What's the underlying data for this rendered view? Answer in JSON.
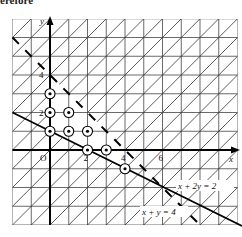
{
  "header_fragment": "erefore",
  "diagram": {
    "type": "linear-programming-feasible-region",
    "axes": {
      "x_label": "x",
      "y_label": "y",
      "origin_label": "O",
      "x_ticks": [
        {
          "value": 2,
          "label": "2"
        },
        {
          "value": 4,
          "label": "4"
        },
        {
          "value": 6,
          "label": "6"
        }
      ],
      "y_ticks": [
        {
          "value": 2,
          "label": "2"
        },
        {
          "value": 4,
          "label": "4"
        }
      ]
    },
    "grid": {
      "x_range": [
        -2,
        10
      ],
      "y_range": [
        -4,
        7
      ],
      "step": 1
    },
    "lines": [
      {
        "equation": "x + 2y = 2",
        "label": "x + 2y = 2",
        "style": "solid"
      },
      {
        "equation": "x + y = 4",
        "label": "x + y = 4",
        "style": "dashed"
      }
    ],
    "shading": "hatched region excluded (outside feasible set)",
    "lattice_points": [
      [
        0,
        1
      ],
      [
        0,
        2
      ],
      [
        0,
        3
      ],
      [
        1,
        1
      ],
      [
        1,
        2
      ],
      [
        2,
        0
      ],
      [
        2,
        1
      ],
      [
        3,
        0
      ],
      [
        4,
        -1
      ]
    ],
    "colors": {
      "ink": "#111111",
      "grid": "#444444",
      "background": "#ffffff"
    }
  }
}
